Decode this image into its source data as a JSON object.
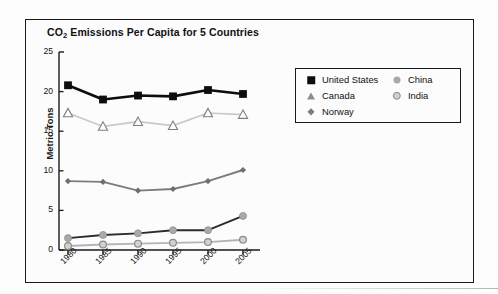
{
  "figure": {
    "title_main": "CO",
    "title_sub": "2",
    "title_rest": " Emissions Per Capita for 5 Countries"
  },
  "legend": {
    "entries": [
      {
        "label": "United States",
        "marker": "filled-square-marker",
        "color": "#0d0d0d"
      },
      {
        "label": "Canada",
        "marker": "open-triangle-marker",
        "color": "#8d8d8d"
      },
      {
        "label": "Norway",
        "marker": "diamond-marker",
        "color": "#7c7c7c"
      },
      {
        "label": "China",
        "marker": "filled-circle-marker",
        "color": "#a9a9a9"
      },
      {
        "label": "India",
        "marker": "open-circle-marker",
        "color": "#8a8a8a"
      }
    ]
  },
  "chart_data": {
    "type": "line",
    "title": "CO2 Emissions Per Capita for 5 Countries",
    "xlabel": "",
    "ylabel": "Metric Tons",
    "categories": [
      "1980",
      "1985",
      "1990",
      "1995",
      "2000",
      "2005"
    ],
    "x": [
      1980,
      1985,
      1990,
      1995,
      2000,
      2005
    ],
    "ylim": [
      0,
      25
    ],
    "yticks": [
      0,
      5,
      10,
      15,
      20,
      25
    ],
    "grid": false,
    "legend_position": "right",
    "series": [
      {
        "name": "United States",
        "values": [
          20.8,
          19.0,
          19.5,
          19.4,
          20.2,
          19.7
        ],
        "color": "#0d0d0d",
        "marker": "filled-square-marker"
      },
      {
        "name": "Canada",
        "values": [
          17.3,
          15.6,
          16.2,
          15.7,
          17.3,
          17.1
        ],
        "color": "#c8c8c8",
        "marker": "open-triangle-marker"
      },
      {
        "name": "Norway",
        "values": [
          8.7,
          8.6,
          7.5,
          7.7,
          8.7,
          10.1
        ],
        "color": "#7c7c7c",
        "marker": "diamond-marker"
      },
      {
        "name": "China",
        "values": [
          1.5,
          1.9,
          2.1,
          2.5,
          2.5,
          4.3
        ],
        "color": "#2b2b2b",
        "marker": "filled-circle-marker"
      },
      {
        "name": "India",
        "values": [
          0.5,
          0.7,
          0.8,
          0.9,
          1.0,
          1.3
        ],
        "color": "#b4b4b4",
        "marker": "open-circle-marker"
      }
    ]
  }
}
